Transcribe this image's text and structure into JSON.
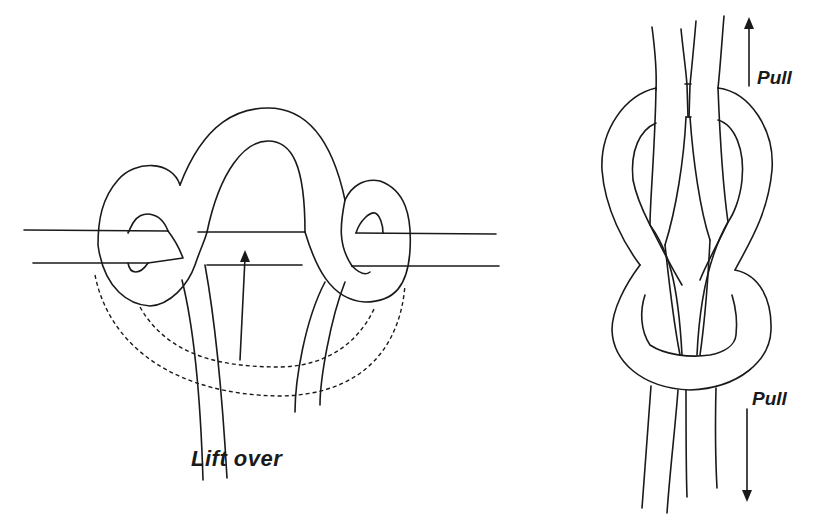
{
  "diagram": {
    "type": "knot-instruction-illustration",
    "left_panel": {
      "name": "figure-eight-bend-step",
      "label": "Lift over",
      "arrow_direction": "up"
    },
    "right_panel": {
      "name": "finished-figure-eight-knot",
      "top_label": "Pull",
      "top_arrow_direction": "up",
      "bottom_label": "Pull",
      "bottom_arrow_direction": "down"
    },
    "colors": {
      "line": "#1a1a1a",
      "background": "#ffffff"
    }
  }
}
